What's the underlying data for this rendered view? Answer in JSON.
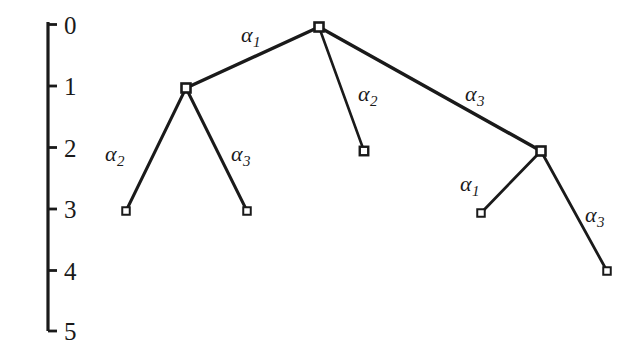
{
  "figure": {
    "kind": "tree-diagram-with-depth-axis",
    "background_color": "#ffffff",
    "ink_color": "#1a1a1a",
    "axis": {
      "name": "depth-axis",
      "orientation": "vertical",
      "x": 48,
      "y_top": 22,
      "y_bottom": 331,
      "tick_length": 9,
      "ticks": [
        {
          "value": "0",
          "y": 24.5
        },
        {
          "value": "1",
          "y": 86
        },
        {
          "value": "2",
          "y": 147.5
        },
        {
          "value": "3",
          "y": 209
        },
        {
          "value": "4",
          "y": 270.5
        },
        {
          "value": "5",
          "y": 331
        }
      ],
      "tick_label_x": 64
    },
    "nodes": [
      {
        "id": "root",
        "x": 319,
        "y": 27,
        "depth": 0,
        "size": 9,
        "stroke": 2.6
      },
      {
        "id": "n1",
        "x": 186,
        "y": 88,
        "depth": 1,
        "size": 9,
        "stroke": 2.6
      },
      {
        "id": "leaf-a",
        "x": 126,
        "y": 211,
        "depth": 3,
        "size": 7.5,
        "stroke": 2.0
      },
      {
        "id": "leaf-b",
        "x": 247,
        "y": 211,
        "depth": 3,
        "size": 7.5,
        "stroke": 2.0
      },
      {
        "id": "leaf-c",
        "x": 364,
        "y": 151,
        "depth": 2,
        "size": 8.5,
        "stroke": 2.4
      },
      {
        "id": "n2",
        "x": 541,
        "y": 151,
        "depth": 2,
        "size": 9,
        "stroke": 2.6
      },
      {
        "id": "leaf-d",
        "x": 481,
        "y": 213,
        "depth": 3,
        "size": 7.5,
        "stroke": 2.0
      },
      {
        "id": "leaf-e",
        "x": 607,
        "y": 271,
        "depth": 4,
        "size": 7.5,
        "stroke": 2.0
      }
    ],
    "edges": [
      {
        "id": "root-n1",
        "from": "root",
        "to": "n1",
        "x1": 319,
        "y1": 27,
        "x2": 186,
        "y2": 88,
        "width": 3.4
      },
      {
        "id": "n1-leaf-a",
        "from": "n1",
        "to": "leaf-a",
        "x1": 186,
        "y1": 88,
        "x2": 126,
        "y2": 211,
        "width": 3.0
      },
      {
        "id": "n1-leaf-b",
        "from": "n1",
        "to": "leaf-b",
        "x1": 186,
        "y1": 88,
        "x2": 247,
        "y2": 211,
        "width": 3.0
      },
      {
        "id": "root-leaf-c",
        "from": "root",
        "to": "leaf-c",
        "x1": 319,
        "y1": 27,
        "x2": 364,
        "y2": 151,
        "width": 2.6
      },
      {
        "id": "root-n2",
        "from": "root",
        "to": "n2",
        "x1": 319,
        "y1": 27,
        "x2": 541,
        "y2": 151,
        "width": 3.4
      },
      {
        "id": "n2-leaf-d",
        "from": "n2",
        "to": "leaf-d",
        "x1": 541,
        "y1": 151,
        "x2": 481,
        "y2": 213,
        "width": 2.8
      },
      {
        "id": "n2-leaf-e",
        "from": "n2",
        "to": "leaf-e",
        "x1": 541,
        "y1": 151,
        "x2": 607,
        "y2": 271,
        "width": 2.8
      }
    ],
    "edge_labels": [
      {
        "id": "label-root-n1",
        "edge": "root-n1",
        "base": "α",
        "sub": "1",
        "x": 241,
        "y": 24
      },
      {
        "id": "label-n1-leaf-a",
        "edge": "n1-leaf-a",
        "base": "α",
        "sub": "2",
        "x": 105,
        "y": 143
      },
      {
        "id": "label-n1-leaf-b",
        "edge": "n1-leaf-b",
        "base": "α",
        "sub": "3",
        "x": 231,
        "y": 143
      },
      {
        "id": "label-root-leaf-c",
        "edge": "root-leaf-c",
        "base": "α",
        "sub": "2",
        "x": 358,
        "y": 83
      },
      {
        "id": "label-root-n2",
        "edge": "root-n2",
        "base": "α",
        "sub": "3",
        "x": 465,
        "y": 83
      },
      {
        "id": "label-n2-leaf-d",
        "edge": "n2-leaf-d",
        "base": "α",
        "sub": "1",
        "x": 460,
        "y": 173
      },
      {
        "id": "label-n2-leaf-e",
        "edge": "n2-leaf-e",
        "base": "α",
        "sub": "3",
        "x": 585,
        "y": 204
      }
    ]
  }
}
